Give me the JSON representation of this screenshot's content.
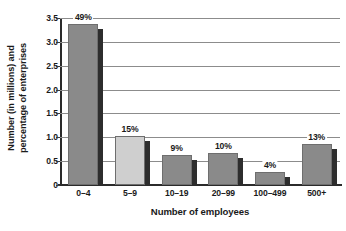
{
  "chart_data": {
    "type": "bar",
    "title": "",
    "xlabel": "Number of employees",
    "ylabel_line1": "Number (in millions) and",
    "ylabel_line2": "percentage of enterprises",
    "categories": [
      "0–4",
      "5–9",
      "10–19",
      "20–99",
      "100–499",
      "500+"
    ],
    "values": [
      3.38,
      1.03,
      0.62,
      0.67,
      0.28,
      0.86
    ],
    "data_labels": [
      "49%",
      "15%",
      "9%",
      "10%",
      "4%",
      "13%"
    ],
    "ylim": [
      0,
      3.5
    ],
    "yticks": [
      "0",
      "0.5",
      "1.0",
      "1.5",
      "2.0",
      "2.5",
      "3.0",
      "3.5"
    ],
    "ytick_values": [
      0,
      0.5,
      1.0,
      1.5,
      2.0,
      2.5,
      3.0,
      3.5
    ],
    "grid": true,
    "legend": "none",
    "bar_colors": [
      "#8a8a8a",
      "#cfcfcf",
      "#8a8a8a",
      "#8a8a8a",
      "#8a8a8a",
      "#8a8a8a"
    ],
    "shadow_color": "#2d2d2d",
    "grid_color": "#8c8c8c",
    "axis_color": "#2b2b2b"
  }
}
